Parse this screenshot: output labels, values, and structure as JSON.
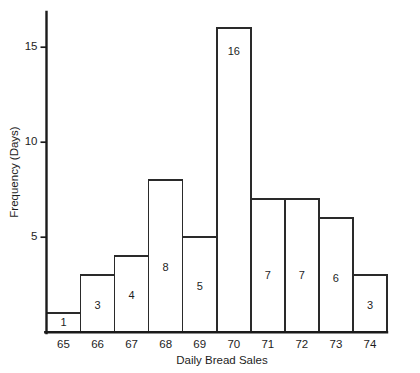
{
  "chart_data": {
    "type": "bar",
    "title": "",
    "xlabel": "Daily Bread Sales",
    "ylabel": "Frequency (Days)",
    "categories": [
      "65",
      "66",
      "67",
      "68",
      "69",
      "70",
      "71",
      "72",
      "73",
      "74"
    ],
    "values": [
      1,
      3,
      4,
      8,
      5,
      16,
      7,
      7,
      6,
      3
    ],
    "value_labels": [
      "1",
      "3",
      "4",
      "8",
      "5",
      "16",
      "7",
      "7",
      "6",
      "3"
    ],
    "ytick_labels": [
      "5",
      "10",
      "15"
    ],
    "ytick_values": [
      5,
      10,
      15
    ],
    "ylim": [
      0,
      17
    ],
    "xlim": [
      64.5,
      74.5
    ],
    "grid": false,
    "legend": false,
    "bar_fill_color": "#ffffff",
    "bar_edge_color": "#2a2a2a",
    "axis_color": "#1b1b1b",
    "text_color": "#1d1d1d",
    "background_color": "#ffffff"
  }
}
